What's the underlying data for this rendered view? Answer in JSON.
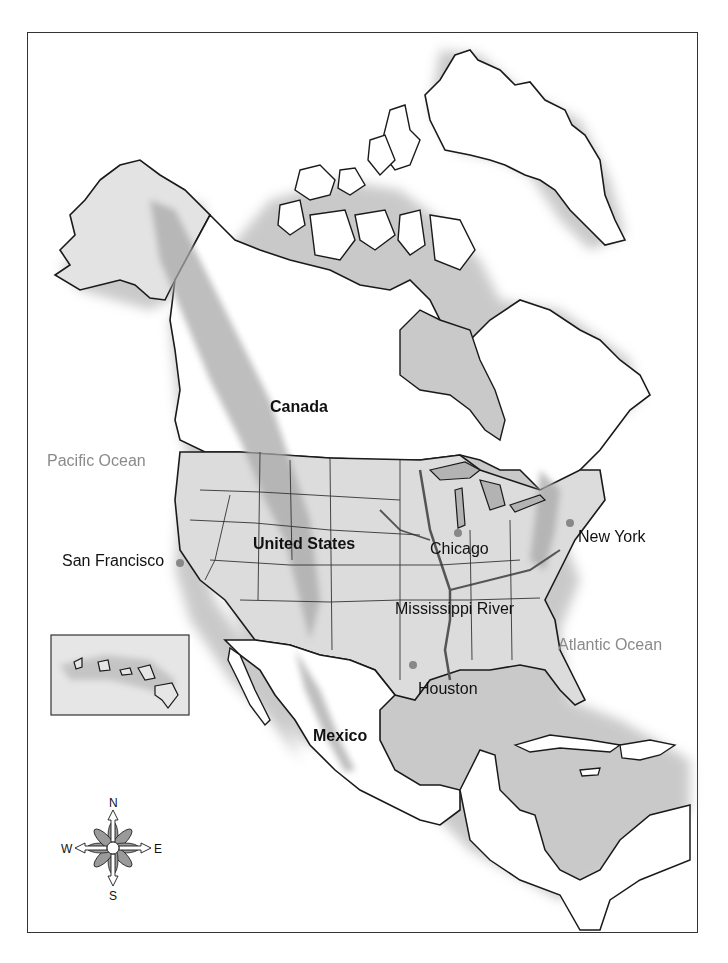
{
  "map": {
    "title": "",
    "countries": [
      {
        "name": "Canada",
        "x": 270,
        "y": 400
      },
      {
        "name": "United States",
        "x": 253,
        "y": 537
      },
      {
        "name": "Mexico",
        "x": 313,
        "y": 728
      }
    ],
    "cities": [
      {
        "name": "San Francisco",
        "x": 62,
        "y": 552
      },
      {
        "name": "Chicago",
        "x": 430,
        "y": 540
      },
      {
        "name": "New York",
        "x": 578,
        "y": 528
      },
      {
        "name": "Houston",
        "x": 418,
        "y": 680
      }
    ],
    "features": [
      {
        "name": "Mississippi River",
        "x": 395,
        "y": 600
      }
    ],
    "oceans": [
      {
        "name": "Pacific Ocean",
        "x": 47,
        "y": 452
      },
      {
        "name": "Atlantic Ocean",
        "x": 558,
        "y": 636
      }
    ],
    "inset": {
      "name": "Hawaii inset"
    },
    "compass": {
      "n": "N",
      "s": "S",
      "e": "E",
      "w": "W"
    },
    "colors": {
      "land": "#ffffff",
      "us_land": "#d9d9d9",
      "water_shade": "#bdbdbd",
      "mountains": "#9a9a9a",
      "outline": "#1a1a1a",
      "ocean_label": "#8a8a8a",
      "city_dot": "#888888"
    }
  }
}
